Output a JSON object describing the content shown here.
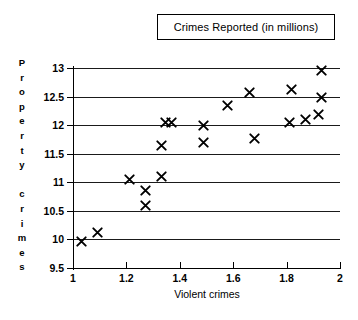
{
  "title": {
    "text": "Crimes Reported (in millions)"
  },
  "axes": {
    "y_caption": "Property crimes",
    "y_caption_letters": [
      "P",
      "r",
      "o",
      "p",
      "e",
      "r",
      "t",
      "y",
      "",
      "c",
      "r",
      "i",
      "m",
      "e",
      "s"
    ],
    "x_title": "Violent crimes",
    "y_ticks": [
      "13",
      "12.5",
      "12",
      "11.5",
      "11",
      "10.5",
      "10",
      "9.5"
    ],
    "x_ticks": [
      "1",
      "1.2",
      "1.4",
      "1.6",
      "1.8",
      "2"
    ]
  },
  "chart_data": {
    "type": "scatter",
    "title": "Crimes Reported (in millions)",
    "xlabel": "Violent crimes",
    "ylabel": "Property crimes",
    "xlim": [
      1,
      2
    ],
    "ylim": [
      9.5,
      13
    ],
    "xticks": [
      1,
      1.2,
      1.4,
      1.6,
      1.8,
      2
    ],
    "yticks": [
      9.5,
      10,
      10.5,
      11,
      11.5,
      12,
      12.5,
      13
    ],
    "grid": "horizontal",
    "legend": null,
    "marker": "x",
    "points": [
      {
        "x": 1.03,
        "y": 9.97
      },
      {
        "x": 1.09,
        "y": 10.12
      },
      {
        "x": 1.27,
        "y": 10.6
      },
      {
        "x": 1.27,
        "y": 10.85
      },
      {
        "x": 1.21,
        "y": 11.05
      },
      {
        "x": 1.33,
        "y": 11.1
      },
      {
        "x": 1.33,
        "y": 11.65
      },
      {
        "x": 1.49,
        "y": 11.7
      },
      {
        "x": 1.68,
        "y": 11.76
      },
      {
        "x": 1.345,
        "y": 12.05
      },
      {
        "x": 1.37,
        "y": 12.05
      },
      {
        "x": 1.49,
        "y": 12.0
      },
      {
        "x": 1.81,
        "y": 12.04
      },
      {
        "x": 1.87,
        "y": 12.1
      },
      {
        "x": 1.92,
        "y": 12.18
      },
      {
        "x": 1.58,
        "y": 12.35
      },
      {
        "x": 1.93,
        "y": 12.48
      },
      {
        "x": 1.66,
        "y": 12.57
      },
      {
        "x": 1.82,
        "y": 12.62
      },
      {
        "x": 1.93,
        "y": 12.95
      }
    ]
  }
}
